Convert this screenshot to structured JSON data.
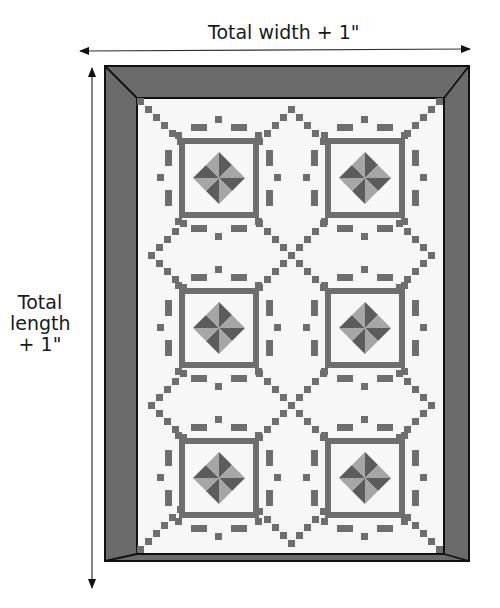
{
  "diagram": {
    "type": "quilt-measurement-diagram",
    "width_label": "Total width + 1\"",
    "length_label_lines": [
      "Total",
      "length",
      "+ 1\""
    ],
    "colors": {
      "border_fill": "#6b6b6b",
      "outline": "#111111",
      "quilt_background": "#f7f7f7",
      "pixel_dark": "#6e6e6e",
      "tri_dark": "#5c5c5c",
      "tri_light": "#a6a6a6",
      "arrow": "#111111"
    },
    "frame": {
      "outer": [
        105,
        66,
        469,
        561
      ],
      "inner": [
        137,
        98,
        444,
        554
      ]
    },
    "blocks": {
      "columns": 2,
      "rows": 3,
      "centers": [
        [
          219,
          178
        ],
        [
          365,
          178
        ],
        [
          219,
          328
        ],
        [
          365,
          328
        ],
        [
          219,
          478
        ],
        [
          365,
          478
        ]
      ]
    }
  }
}
